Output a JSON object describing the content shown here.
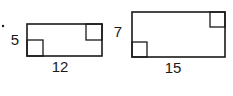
{
  "figure": {
    "bullet": {
      "x": 3,
      "y": 26,
      "r": 1.2
    },
    "rectangles": [
      {
        "id": "rect-small",
        "x": 27,
        "y": 24,
        "w": 75,
        "h": 32,
        "height_label": "5",
        "width_label": "12",
        "square_size": 16,
        "height_label_pos": {
          "x": 15,
          "y": 45
        },
        "width_label_pos": {
          "x": 60,
          "y": 72
        }
      },
      {
        "id": "rect-large",
        "x": 132,
        "y": 12,
        "w": 93,
        "h": 45,
        "height_label": "7",
        "width_label": "15",
        "square_size": 15,
        "height_label_pos": {
          "x": 118,
          "y": 37
        },
        "width_label_pos": {
          "x": 173,
          "y": 73
        }
      }
    ],
    "stroke_color": "#1a1a1a"
  }
}
